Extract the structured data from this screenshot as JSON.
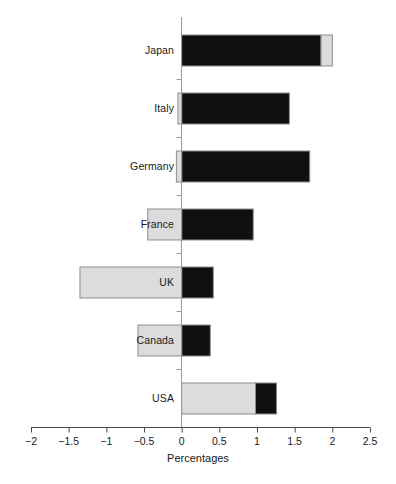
{
  "chart_data": {
    "type": "bar",
    "orientation": "horizontal",
    "stacked": true,
    "title": "",
    "xlabel": "Percentages",
    "ylabel": "",
    "xlim": [
      -2,
      2.5
    ],
    "xticks": [
      -2,
      -1.5,
      -1,
      -0.5,
      0,
      0.5,
      1,
      1.5,
      2,
      2.5
    ],
    "xtick_labels": [
      "−2",
      "−1.5",
      "−1",
      "−0.5",
      "0",
      "0.5",
      "1",
      "1.5",
      "2",
      "2.5"
    ],
    "grid": false,
    "legend": "none",
    "zero_line": true,
    "categories": [
      "Japan",
      "Italy",
      "Germany",
      "France",
      "UK",
      "Canada",
      "USA"
    ],
    "series": [
      {
        "name": "black-segment",
        "color": "#101010",
        "segments": [
          {
            "category": "Japan",
            "start": 0.0,
            "end": 1.85
          },
          {
            "category": "Italy",
            "start": 0.0,
            "end": 1.43
          },
          {
            "category": "Germany",
            "start": 0.0,
            "end": 1.7
          },
          {
            "category": "France",
            "start": 0.0,
            "end": 0.95
          },
          {
            "category": "UK",
            "start": 0.0,
            "end": 0.42
          },
          {
            "category": "Canada",
            "start": 0.0,
            "end": 0.38
          },
          {
            "category": "USA",
            "start": 0.98,
            "end": 1.26
          }
        ]
      },
      {
        "name": "light-gray-segment",
        "color": "#dcdcdc",
        "segments": [
          {
            "category": "Japan",
            "start": 1.85,
            "end": 2.0
          },
          {
            "category": "Italy",
            "start": -0.05,
            "end": 0.0
          },
          {
            "category": "Germany",
            "start": -0.07,
            "end": 0.0
          },
          {
            "category": "France",
            "start": -0.45,
            "end": 0.0
          },
          {
            "category": "UK",
            "start": -1.35,
            "end": 0.0
          },
          {
            "category": "Canada",
            "start": -0.58,
            "end": 0.0
          },
          {
            "category": "USA",
            "start": 0.0,
            "end": 0.98
          }
        ]
      }
    ],
    "totals": {
      "Japan": 2.0,
      "Italy": 1.43,
      "Germany": 1.7,
      "France": 0.95,
      "UK": 0.42,
      "Canada": 0.38,
      "USA": 1.26
    }
  },
  "axis": {
    "x_title": "Percentages"
  }
}
